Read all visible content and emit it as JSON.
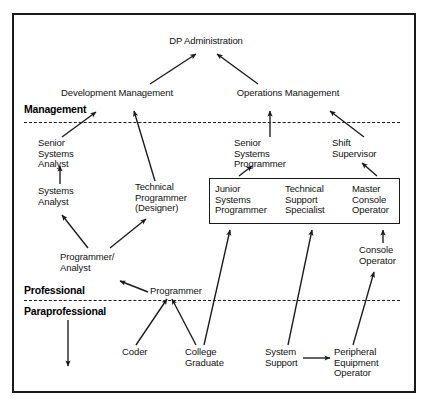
{
  "diagram": {
    "frame": {
      "border_color": "#1a1a1a"
    },
    "bands": [
      {
        "id": "management",
        "label": "Management"
      },
      {
        "id": "professional",
        "label": "Professional"
      },
      {
        "id": "paraprofessional",
        "label": "Paraprofessional"
      }
    ],
    "nodes": [
      {
        "id": "dp-administration",
        "label": "DP Administration"
      },
      {
        "id": "development-management",
        "label": "Development Management"
      },
      {
        "id": "operations-management",
        "label": "Operations Management"
      },
      {
        "id": "senior-systems-analyst",
        "label": "Senior\nSystems\nAnalyst"
      },
      {
        "id": "senior-systems-programmer",
        "label": "Senior\nSystems\nProgrammer"
      },
      {
        "id": "shift-supervisor",
        "label": "Shift\nSupervisor"
      },
      {
        "id": "systems-analyst",
        "label": "Systems\nAnalyst"
      },
      {
        "id": "technical-programmer",
        "label": "Technical\nProgrammer\n(Designer)"
      },
      {
        "id": "junior-systems-programmer",
        "label": "Junior\nSystems\nProgrammer"
      },
      {
        "id": "technical-support-specialist",
        "label": "Technical\nSupport\nSpecialist"
      },
      {
        "id": "master-console-operator",
        "label": "Master\nConsole\nOperator"
      },
      {
        "id": "console-operator",
        "label": "Console\nOperator"
      },
      {
        "id": "programmer-analyst",
        "label": "Programmer/\nAnalyst"
      },
      {
        "id": "programmer",
        "label": "Programmer"
      },
      {
        "id": "coder",
        "label": "Coder"
      },
      {
        "id": "college-graduate",
        "label": "College\nGraduate"
      },
      {
        "id": "system-support",
        "label": "System\nSupport"
      },
      {
        "id": "peripheral-equipment-operator",
        "label": "Peripheral\nEquipment\nOperator"
      }
    ],
    "edges": [
      {
        "from": "development-management",
        "to": "dp-administration"
      },
      {
        "from": "operations-management",
        "to": "dp-administration"
      },
      {
        "from": "senior-systems-analyst",
        "to": "development-management"
      },
      {
        "from": "technical-programmer",
        "to": "development-management"
      },
      {
        "from": "senior-systems-programmer",
        "to": "operations-management"
      },
      {
        "from": "shift-supervisor",
        "to": "operations-management"
      },
      {
        "from": "systems-analyst",
        "to": "senior-systems-analyst"
      },
      {
        "from": "programmer-analyst",
        "to": "systems-analyst"
      },
      {
        "from": "programmer-analyst",
        "to": "technical-programmer"
      },
      {
        "from": "programmer",
        "to": "programmer-analyst"
      },
      {
        "from": "coder",
        "to": "programmer"
      },
      {
        "from": "college-graduate",
        "to": "programmer"
      },
      {
        "from": "college-graduate",
        "to": "junior-systems-programmer"
      },
      {
        "from": "junior-systems-programmer",
        "to": "senior-systems-programmer"
      },
      {
        "from": "master-console-operator",
        "to": "shift-supervisor"
      },
      {
        "from": "console-operator",
        "to": "master-console-operator"
      },
      {
        "from": "system-support",
        "to": "technical-support-specialist"
      },
      {
        "from": "system-support",
        "to": "peripheral-equipment-operator"
      },
      {
        "from": "peripheral-equipment-operator",
        "to": "console-operator"
      },
      {
        "from": "paraprofessional-entry",
        "to": "paraprofessional-exit"
      }
    ]
  }
}
